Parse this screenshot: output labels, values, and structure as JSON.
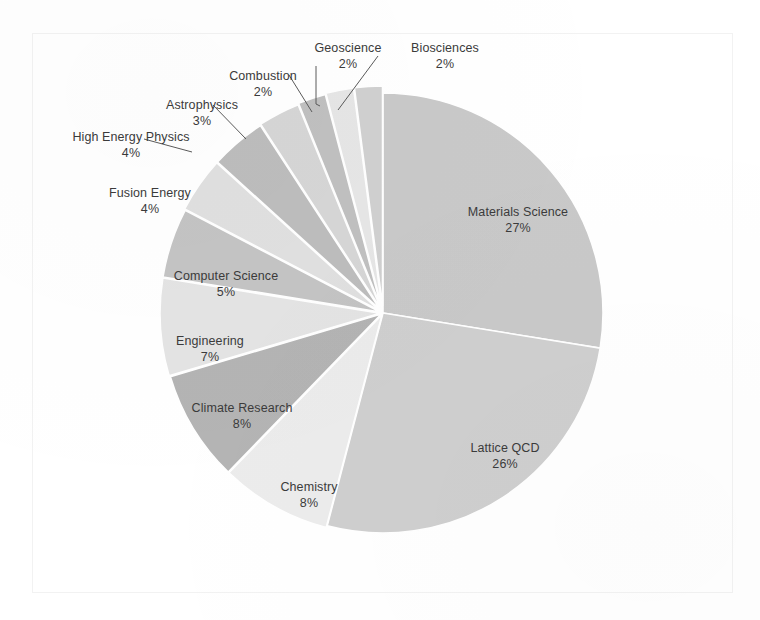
{
  "chart_data": {
    "type": "pie",
    "title": "",
    "subtitle": "",
    "xlabel": "",
    "ylabel": "",
    "legend_position": "none",
    "grid": false,
    "units": "percent",
    "start_angle_deg": 0,
    "direction": "clockwise",
    "categories": [
      "Materials Science",
      "Lattice QCD",
      "Chemistry",
      "Climate Research",
      "Engineering",
      "Computer Science",
      "Fusion Energy",
      "High Energy Physics",
      "Astrophysics",
      "Combustion",
      "Geoscience",
      "Biosciences"
    ],
    "values": [
      27,
      26,
      8,
      8,
      7,
      5,
      4,
      4,
      3,
      2,
      2,
      2
    ],
    "slices": [
      {
        "label": "Materials Science",
        "value": 27,
        "pct_text": "27%",
        "color": "#c9c9c9"
      },
      {
        "label": "Lattice QCD",
        "value": 26,
        "pct_text": "26%",
        "color": "#cfcfcf"
      },
      {
        "label": "Chemistry",
        "value": 8,
        "pct_text": "8%",
        "color": "#ececec"
      },
      {
        "label": "Climate Research",
        "value": 8,
        "pct_text": "8%",
        "color": "#b4b4b4"
      },
      {
        "label": "Engineering",
        "value": 7,
        "pct_text": "7%",
        "color": "#e4e4e4"
      },
      {
        "label": "Computer Science",
        "value": 5,
        "pct_text": "5%",
        "color": "#c4c4c4"
      },
      {
        "label": "Fusion Energy",
        "value": 4,
        "pct_text": "4%",
        "color": "#e0e0e0"
      },
      {
        "label": "High Energy Physics",
        "value": 4,
        "pct_text": "4%",
        "color": "#bdbdbd"
      },
      {
        "label": "Astrophysics",
        "value": 3,
        "pct_text": "3%",
        "color": "#d6d6d6"
      },
      {
        "label": "Combustion",
        "value": 2,
        "pct_text": "2%",
        "color": "#c0c0c0"
      },
      {
        "label": "Geoscience",
        "value": 2,
        "pct_text": "2%",
        "color": "#e6e6e6"
      },
      {
        "label": "Biosciences",
        "value": 2,
        "pct_text": "2%",
        "color": "#d0d0d0"
      }
    ]
  },
  "labels": [
    {
      "name": "Geoscience",
      "pct": "2%",
      "x": 300,
      "y": 40,
      "align": "c",
      "width": 96
    },
    {
      "name": "Biosciences",
      "pct": "2%",
      "x": 396,
      "y": 40,
      "align": "c",
      "width": 98
    },
    {
      "name": "Combustion",
      "pct": "2%",
      "x": 215,
      "y": 68,
      "align": "c",
      "width": 96
    },
    {
      "name": "Astrophysics",
      "pct": "3%",
      "x": 150,
      "y": 97,
      "align": "c",
      "width": 104
    },
    {
      "name": "High Energy Physics",
      "pct": "4%",
      "x": 57,
      "y": 129,
      "align": "c",
      "width": 148
    },
    {
      "name": "Fusion Energy",
      "pct": "4%",
      "x": 92,
      "y": 185,
      "align": "c",
      "width": 116
    },
    {
      "name": "Computer Science",
      "pct": "5%",
      "x": 158,
      "y": 268,
      "align": "c",
      "width": 136
    },
    {
      "name": "Engineering",
      "pct": "7%",
      "x": 157,
      "y": 333,
      "align": "c",
      "width": 106
    },
    {
      "name": "Climate Research",
      "pct": "8%",
      "x": 172,
      "y": 400,
      "align": "c",
      "width": 140
    },
    {
      "name": "Chemistry",
      "pct": "8%",
      "x": 257,
      "y": 479,
      "align": "c",
      "width": 104
    },
    {
      "name": "Lattice QCD",
      "pct": "26%",
      "x": 450,
      "y": 440,
      "align": "c",
      "width": 110
    },
    {
      "name": "Materials Science",
      "pct": "27%",
      "x": 450,
      "y": 204,
      "align": "c",
      "width": 136
    }
  ],
  "geometry": {
    "center_x": 383,
    "center_y": 313,
    "radius": 220,
    "frame": {
      "left": 32,
      "top": 33,
      "width": 701,
      "height": 560
    }
  },
  "colors": {
    "background": "#ffffff",
    "frame_border": "#f2f2f2",
    "label_text": "#3b3b3b",
    "leader_line": "#5a5a5a",
    "slice_stroke": "#ffffff"
  }
}
